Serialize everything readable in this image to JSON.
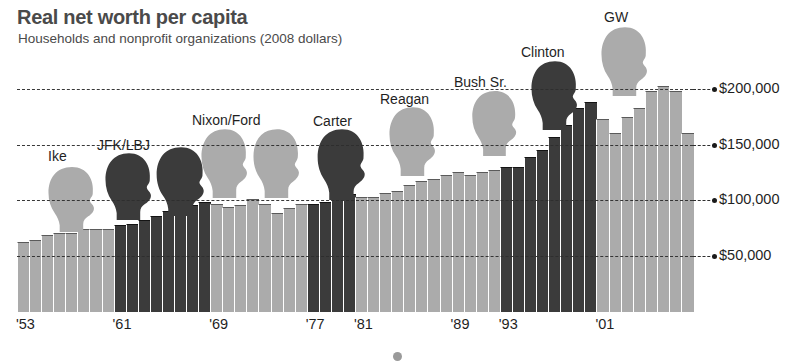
{
  "header": {
    "title": "Real net worth per capita",
    "subtitle": "Households and nonprofit organizations (2008 dollars)"
  },
  "colors": {
    "democrat_bar": "#3b3b3b",
    "republican_bar": "#ababab",
    "gridline": "#2e2e2e",
    "text": "#1f1f1f",
    "title": "#4a4a4a"
  },
  "chart_data": {
    "type": "bar",
    "title": "Real net worth per capita",
    "subtitle": "Households and nonprofit organizations (2008 dollars)",
    "xlabel": "",
    "ylabel": "",
    "ylim": [
      0,
      225000
    ],
    "grid": true,
    "legend_position": "none",
    "y_ticks": [
      {
        "value": 50000,
        "label": "$50,000"
      },
      {
        "value": 100000,
        "label": "$100,000"
      },
      {
        "value": 150000,
        "label": "$150,000"
      },
      {
        "value": 200000,
        "label": "$200,000"
      }
    ],
    "x_ticks": [
      {
        "year": 1953,
        "label": "'53"
      },
      {
        "year": 1961,
        "label": "'61"
      },
      {
        "year": 1969,
        "label": "'69"
      },
      {
        "year": 1977,
        "label": "'77"
      },
      {
        "year": 1981,
        "label": "'81"
      },
      {
        "year": 1989,
        "label": "'89"
      },
      {
        "year": 1993,
        "label": "'93"
      },
      {
        "year": 2001,
        "label": "'01"
      }
    ],
    "categories": [
      1953,
      1954,
      1955,
      1956,
      1957,
      1958,
      1959,
      1960,
      1961,
      1962,
      1963,
      1964,
      1965,
      1966,
      1967,
      1968,
      1969,
      1970,
      1971,
      1972,
      1973,
      1974,
      1975,
      1976,
      1977,
      1978,
      1979,
      1980,
      1981,
      1982,
      1983,
      1984,
      1985,
      1986,
      1987,
      1988,
      1989,
      1990,
      1991,
      1992,
      1993,
      1994,
      1995,
      1996,
      1997,
      1998,
      1999,
      2000,
      2001,
      2002,
      2003,
      2004,
      2005,
      2006,
      2007,
      2008
    ],
    "values": [
      70000,
      72000,
      76000,
      78000,
      78000,
      82000,
      82000,
      82000,
      85000,
      86000,
      90000,
      93000,
      98000,
      97000,
      103000,
      106000,
      104000,
      101000,
      103000,
      108000,
      104000,
      96000,
      100000,
      104000,
      104000,
      106000,
      110000,
      113000,
      110000,
      110000,
      114000,
      116000,
      121000,
      125000,
      126000,
      130000,
      133000,
      130000,
      133000,
      134000,
      137000,
      137000,
      146000,
      152000,
      164000,
      175000,
      190000,
      195000,
      180000,
      168000,
      182000,
      190000,
      205000,
      210000,
      205000,
      168000
    ],
    "party_by_year": [
      "rep",
      "rep",
      "rep",
      "rep",
      "rep",
      "rep",
      "rep",
      "rep",
      "dem",
      "dem",
      "dem",
      "dem",
      "dem",
      "dem",
      "dem",
      "dem",
      "rep",
      "rep",
      "rep",
      "rep",
      "rep",
      "rep",
      "rep",
      "rep",
      "dem",
      "dem",
      "dem",
      "dem",
      "rep",
      "rep",
      "rep",
      "rep",
      "rep",
      "rep",
      "rep",
      "rep",
      "rep",
      "rep",
      "rep",
      "rep",
      "dem",
      "dem",
      "dem",
      "dem",
      "dem",
      "dem",
      "dem",
      "dem",
      "rep",
      "rep",
      "rep",
      "rep",
      "rep",
      "rep",
      "rep",
      "rep"
    ],
    "annotations": [
      {
        "label": "Ike",
        "party": "rep",
        "heads": 1
      },
      {
        "label": "JFK/LBJ",
        "party": "dem",
        "heads": 2
      },
      {
        "label": "Nixon/Ford",
        "party": "rep",
        "heads": 2
      },
      {
        "label": "Carter",
        "party": "dem",
        "heads": 1
      },
      {
        "label": "Reagan",
        "party": "rep",
        "heads": 1
      },
      {
        "label": "Bush Sr.",
        "party": "rep",
        "heads": 1
      },
      {
        "label": "Clinton",
        "party": "dem",
        "heads": 1
      },
      {
        "label": "GW",
        "party": "rep",
        "heads": 1
      }
    ]
  },
  "presidents": [
    {
      "label": "Ike"
    },
    {
      "label": "JFK/LBJ"
    },
    {
      "label": "Nixon/Ford"
    },
    {
      "label": "Carter"
    },
    {
      "label": "Reagan"
    },
    {
      "label": "Bush Sr."
    },
    {
      "label": "Clinton"
    },
    {
      "label": "GW"
    }
  ]
}
